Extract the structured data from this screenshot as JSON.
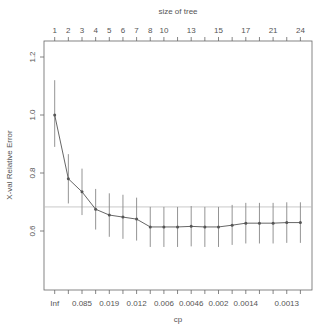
{
  "chart_data": {
    "type": "line",
    "title": "",
    "xlabel": "cp",
    "ylabel": "X-val Relative Error",
    "top_axis_label": "size of tree",
    "ylim": [
      0.49,
      1.28
    ],
    "y_ticks": [
      0.6,
      0.8,
      1.0,
      1.2
    ],
    "y_tick_labels": [
      "0.6",
      "0.8",
      "1.0",
      "1.2"
    ],
    "grid": false,
    "legend": null,
    "reference_line": 0.683,
    "n_points": 19,
    "top_tick_labels": [
      {
        "index": 0,
        "label": "1"
      },
      {
        "index": 1,
        "label": "2"
      },
      {
        "index": 2,
        "label": "3"
      },
      {
        "index": 3,
        "label": "4"
      },
      {
        "index": 4,
        "label": "5"
      },
      {
        "index": 5,
        "label": "6"
      },
      {
        "index": 6,
        "label": "7"
      },
      {
        "index": 7,
        "label": "8"
      },
      {
        "index": 8,
        "label": "10"
      },
      {
        "index": 10,
        "label": "13"
      },
      {
        "index": 12,
        "label": "15"
      },
      {
        "index": 14,
        "label": "17"
      },
      {
        "index": 16,
        "label": "21"
      },
      {
        "index": 18,
        "label": "24"
      }
    ],
    "bottom_tick_labels": [
      {
        "index": 0,
        "label": "Inf"
      },
      {
        "index": 2,
        "label": "0.085"
      },
      {
        "index": 4,
        "label": "0.019"
      },
      {
        "index": 6,
        "label": "0.012"
      },
      {
        "index": 8,
        "label": "0.006"
      },
      {
        "index": 10,
        "label": "0.0046"
      },
      {
        "index": 12,
        "label": "0.002"
      },
      {
        "index": 14,
        "label": "0.0014"
      },
      {
        "index": 17,
        "label": "0.0013"
      }
    ],
    "series": [
      {
        "name": "xerror",
        "values": [
          1.0,
          0.78,
          0.735,
          0.675,
          0.655,
          0.648,
          0.641,
          0.614,
          0.614,
          0.614,
          0.616,
          0.614,
          0.614,
          0.62,
          0.627,
          0.627,
          0.627,
          0.629,
          0.629
        ],
        "upper": [
          1.12,
          0.865,
          0.815,
          0.745,
          0.73,
          0.725,
          0.715,
          0.683,
          0.683,
          0.683,
          0.686,
          0.683,
          0.683,
          0.69,
          0.697,
          0.697,
          0.697,
          0.699,
          0.699
        ],
        "lower": [
          0.89,
          0.695,
          0.655,
          0.605,
          0.58,
          0.573,
          0.567,
          0.545,
          0.545,
          0.545,
          0.547,
          0.545,
          0.545,
          0.552,
          0.557,
          0.557,
          0.557,
          0.559,
          0.559
        ]
      }
    ]
  },
  "colors": {
    "line": "#555555",
    "axis": "#666666",
    "errorbar": "#888888",
    "reference": "#bbbbbb"
  }
}
